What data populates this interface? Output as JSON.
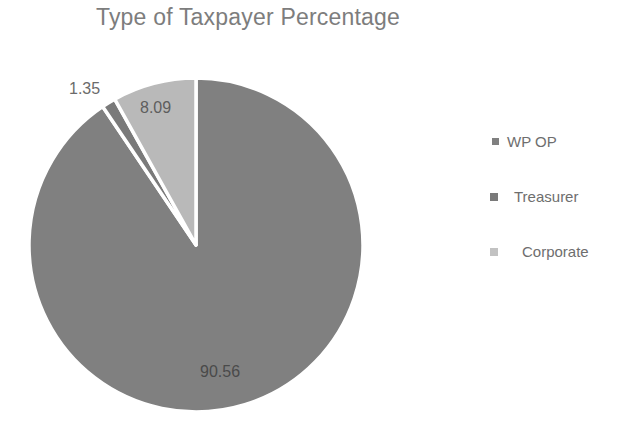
{
  "chart_data": {
    "type": "pie",
    "title": "Type of Taxpayer Percentage",
    "categories": [
      "WP OP",
      "Treasurer",
      "Corporate"
    ],
    "values": [
      90.56,
      1.35,
      8.09
    ],
    "value_labels": [
      "90.56",
      "1.35",
      "8.09"
    ],
    "colors": [
      "#808080",
      "#7a7a7a",
      "#b9b9b9"
    ],
    "start_angle_deg": 0,
    "direction": "clockwise",
    "legend_position": "right",
    "grid": false,
    "xlabel": "",
    "ylabel": "",
    "slice_separator_color": "#ffffff"
  },
  "title": {
    "text": "Type of Taxpayer Percentage",
    "color": "#7d7d7d"
  },
  "labels": {
    "wp_op": "90.56",
    "treasurer": "1.35",
    "corporate": "8.09"
  },
  "legend": {
    "items": [
      {
        "label": "WP OP",
        "color": "#808080"
      },
      {
        "label": "Treasurer",
        "color": "#7a7a7a"
      },
      {
        "label": "Corporate",
        "color": "#c2c2c2"
      }
    ]
  },
  "colors": {
    "background": "#ffffff",
    "slice_wp_op": "#808080",
    "slice_treasurer": "#7a7a7a",
    "slice_corporate": "#b9b9b9",
    "text_gray": "#6e6e6e"
  }
}
